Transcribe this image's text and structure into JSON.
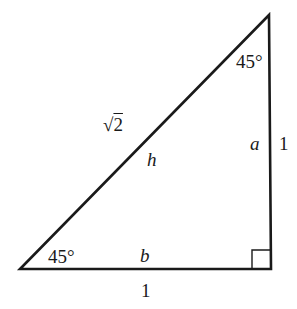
{
  "diagram": {
    "type": "right-triangle",
    "colors": {
      "stroke": "#1a1a1a",
      "background": "#ffffff"
    },
    "vertices": {
      "top": [
        269,
        15
      ],
      "bottom_left": [
        20,
        269
      ],
      "right_angle": [
        271,
        269
      ]
    },
    "angles": {
      "top": "45°",
      "bottom_left": "45°",
      "right_angle_marker": true
    },
    "sides": {
      "hypotenuse": {
        "variable": "h",
        "length": "√2",
        "radical": "2"
      },
      "vertical_leg": {
        "variable": "a",
        "length": "1"
      },
      "horizontal_leg": {
        "variable": "b",
        "length": "1"
      }
    }
  }
}
